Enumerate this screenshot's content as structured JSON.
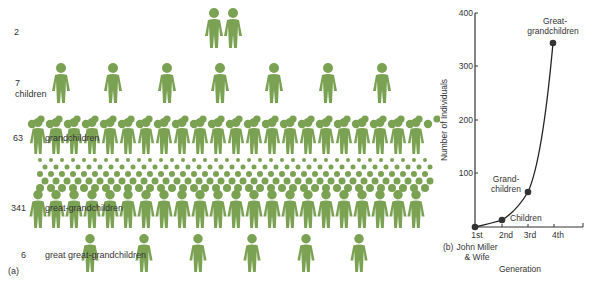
{
  "figure_color": "#7ba253",
  "panel_a": {
    "label": "(a)",
    "rows": [
      {
        "count": "2",
        "label": "",
        "figures": 2
      },
      {
        "count": "7",
        "label": "children",
        "figures": 7
      },
      {
        "count": "63",
        "label": "grandchildren",
        "figures": 63
      },
      {
        "count": "341",
        "label": "great-grandchildren",
        "figures": 341
      },
      {
        "count": "6",
        "label": "great great-grandchildren",
        "figures": 6
      }
    ]
  },
  "panel_b": {
    "label": "(b)",
    "ylabel": "Number of Individuals",
    "xlabel": "Generation",
    "yticks": [
      "100",
      "200",
      "300",
      "400"
    ],
    "xticks": [
      "1st",
      "2nd",
      "3rd",
      "4th"
    ],
    "x0_label_line1": "John Miller",
    "x0_label_line2": "& Wife",
    "annotations": {
      "children": "Children",
      "grand1": "Grand-",
      "grand2": "children",
      "great1": "Great-",
      "great2": "grandchildren"
    }
  },
  "chart_data": {
    "type": "line",
    "title": "",
    "xlabel": "Generation",
    "ylabel": "Number of Individuals",
    "categories": [
      "1st",
      "2nd",
      "3rd",
      "4th"
    ],
    "series": [
      {
        "name": "Descendants",
        "values": [
          2,
          7,
          63,
          341
        ]
      }
    ],
    "point_labels": [
      "John Miller & Wife",
      "Children",
      "Grand-children",
      "Great-grandchildren"
    ],
    "ylim": [
      0,
      400
    ],
    "grid": false
  }
}
